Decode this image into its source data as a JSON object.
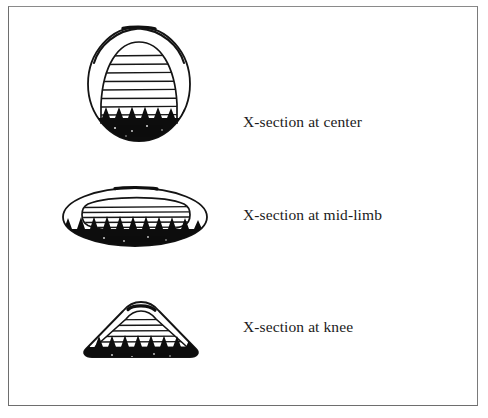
{
  "page": {
    "background_color": "#ffffff",
    "frame_color": "#6e6e6e",
    "ink_color": "#111111",
    "width": 488,
    "height": 418
  },
  "figure_caption_sliver": ". .  . . .  .. . .. ..",
  "rows": [
    {
      "id": "center",
      "label": "X-section at center",
      "drawing_name": "x-section-at-center-drawing",
      "shape": "oval with inner dome, horizontal hatching and black sawtooth base",
      "hatch_line_count": 9
    },
    {
      "id": "mid-limb",
      "label": "X-section at mid-limb",
      "drawing_name": "x-section-at-mid-limb-drawing",
      "shape": "flattened ellipse with inner flattened ellipse, horizontal hatching and black sawtooth base",
      "hatch_line_count": 5
    },
    {
      "id": "knee",
      "label": "X-section at knee",
      "drawing_name": "x-section-at-knee-drawing",
      "shape": "triangular wedge with rounded apex, horizontal hatching and black sawtooth base",
      "hatch_line_count": 6
    }
  ]
}
